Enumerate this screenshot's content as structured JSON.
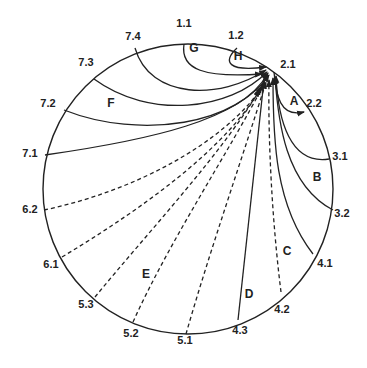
{
  "diagram": {
    "circle": {
      "cx": 188,
      "cy": 189,
      "r": 145
    },
    "target_label": "2.1",
    "target": {
      "x": 272,
      "y": 66
    },
    "point_labels": [
      {
        "id": "1.1",
        "x": 184,
        "y": 27
      },
      {
        "id": "1.2",
        "x": 236,
        "y": 39
      },
      {
        "id": "2.1",
        "x": 288,
        "y": 68
      },
      {
        "id": "2.2",
        "x": 314,
        "y": 107
      },
      {
        "id": "3.1",
        "x": 340,
        "y": 160
      },
      {
        "id": "3.2",
        "x": 342,
        "y": 217
      },
      {
        "id": "4.1",
        "x": 325,
        "y": 267
      },
      {
        "id": "4.2",
        "x": 282,
        "y": 313
      },
      {
        "id": "4.3",
        "x": 240,
        "y": 334
      },
      {
        "id": "5.1",
        "x": 185,
        "y": 344
      },
      {
        "id": "5.2",
        "x": 131,
        "y": 337
      },
      {
        "id": "5.3",
        "x": 86,
        "y": 308
      },
      {
        "id": "6.1",
        "x": 51,
        "y": 268
      },
      {
        "id": "6.2",
        "x": 30,
        "y": 213
      },
      {
        "id": "7.1",
        "x": 30,
        "y": 157
      },
      {
        "id": "7.2",
        "x": 48,
        "y": 107
      },
      {
        "id": "7.3",
        "x": 86,
        "y": 66
      },
      {
        "id": "7.4",
        "x": 133,
        "y": 40
      }
    ],
    "region_labels": [
      {
        "id": "A",
        "x": 294,
        "y": 105
      },
      {
        "id": "B",
        "x": 317,
        "y": 181
      },
      {
        "id": "C",
        "x": 287,
        "y": 255
      },
      {
        "id": "D",
        "x": 249,
        "y": 298
      },
      {
        "id": "E",
        "x": 146,
        "y": 278
      },
      {
        "id": "F",
        "x": 111,
        "y": 107
      },
      {
        "id": "G",
        "x": 194,
        "y": 52
      },
      {
        "id": "H",
        "x": 238,
        "y": 60
      }
    ]
  }
}
